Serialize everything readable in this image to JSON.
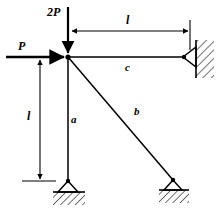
{
  "figure": {
    "type": "statics-truss-diagram",
    "background_color": "#ffffff",
    "line_color": "#000000",
    "loads": [
      {
        "id": "vertical-load",
        "label": "2P",
        "direction": "down",
        "applied_at": "top-joint"
      },
      {
        "id": "horizontal-load",
        "label": "P",
        "direction": "right",
        "applied_at": "top-joint"
      }
    ],
    "dimensions": [
      {
        "id": "horizontal-span",
        "label": "l",
        "orientation": "horizontal"
      },
      {
        "id": "vertical-height",
        "label": "l",
        "orientation": "vertical"
      }
    ],
    "members": [
      {
        "id": "member-a",
        "label": "a",
        "orientation": "vertical"
      },
      {
        "id": "member-b",
        "label": "b",
        "orientation": "diagonal"
      },
      {
        "id": "member-c",
        "label": "c",
        "orientation": "horizontal"
      }
    ],
    "supports": [
      {
        "id": "support-wall-right",
        "kind": "pin-against-hatched-wall"
      },
      {
        "id": "support-ground-left",
        "kind": "pin-on-hatched-ground"
      },
      {
        "id": "support-ground-right",
        "kind": "pin-on-hatched-ground"
      }
    ],
    "joint": {
      "id": "top-joint",
      "kind": "filled-node"
    }
  },
  "labels": {
    "load_2p": "2P",
    "load_p": "P",
    "dim_horizontal": "l",
    "dim_vertical": "l",
    "member_a": "a",
    "member_b": "b",
    "member_c": "c"
  }
}
